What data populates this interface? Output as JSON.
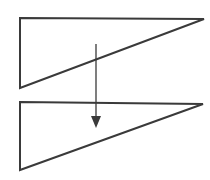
{
  "diagram": {
    "stroke_color": "#3a3a3a",
    "background": "#ffffff",
    "top_triangle": {
      "points": [
        [
          20,
          18
        ],
        [
          204,
          19
        ],
        [
          20,
          88
        ]
      ]
    },
    "bottom_triangle": {
      "points": [
        [
          20,
          102
        ],
        [
          203,
          104
        ],
        [
          20,
          170
        ]
      ]
    },
    "arrow": {
      "x": 96,
      "y_start": 44,
      "y_end": 127,
      "direction": "down"
    }
  }
}
